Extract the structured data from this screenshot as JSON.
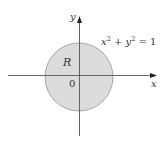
{
  "diagram": {
    "axes": {
      "x_label": "x",
      "y_label": "y",
      "origin_label": "0"
    },
    "region": {
      "label": "R",
      "shape": "disk",
      "fill_color": "#dcdcdc",
      "stroke_color": "#a8a8a8"
    },
    "equation": {
      "lhs_x": "x",
      "exp1": "2",
      "plus": " + ",
      "lhs_y": "y",
      "exp2": "2",
      "rhs": " = 1"
    },
    "colors": {
      "axis": "#555555",
      "text": "#333333",
      "background": "#ffffff"
    }
  }
}
